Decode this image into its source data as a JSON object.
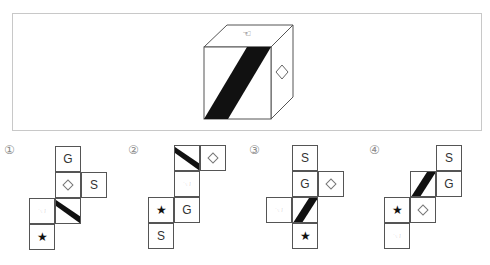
{
  "header": {
    "text": ""
  },
  "problem": {
    "cube": {
      "top_face": "pointing-hand",
      "front_face": "diagonal-stripe",
      "right_face": "diamond"
    }
  },
  "symbols": {
    "G": "G",
    "S": "S",
    "star": "★",
    "pointer": "☜",
    "diamond": "",
    "stripe": ""
  },
  "options": [
    {
      "label": "①",
      "cells": [
        {
          "col": 1,
          "row": 0,
          "sym": "G"
        },
        {
          "col": 1,
          "row": 1,
          "sym": "diamond"
        },
        {
          "col": 2,
          "row": 1,
          "sym": "S"
        },
        {
          "col": 0,
          "row": 2,
          "sym": "pointer"
        },
        {
          "col": 1,
          "row": 2,
          "sym": "stripe-down"
        },
        {
          "col": 0,
          "row": 3,
          "sym": "star"
        }
      ]
    },
    {
      "label": "②",
      "cells": [
        {
          "col": 1,
          "row": 0,
          "sym": "stripe-down"
        },
        {
          "col": 2,
          "row": 0,
          "sym": "diamond"
        },
        {
          "col": 1,
          "row": 1,
          "sym": "pointer"
        },
        {
          "col": 0,
          "row": 2,
          "sym": "star"
        },
        {
          "col": 1,
          "row": 2,
          "sym": "G"
        },
        {
          "col": 0,
          "row": 3,
          "sym": "S"
        }
      ]
    },
    {
      "label": "③",
      "cells": [
        {
          "col": 1,
          "row": 0,
          "sym": "S"
        },
        {
          "col": 1,
          "row": 1,
          "sym": "G"
        },
        {
          "col": 2,
          "row": 1,
          "sym": "diamond"
        },
        {
          "col": 0,
          "row": 2,
          "sym": "pointer"
        },
        {
          "col": 1,
          "row": 2,
          "sym": "stripe-up"
        },
        {
          "col": 1,
          "row": 3,
          "sym": "star"
        }
      ]
    },
    {
      "label": "④",
      "cells": [
        {
          "col": 2,
          "row": 0,
          "sym": "S"
        },
        {
          "col": 1,
          "row": 1,
          "sym": "stripe-up"
        },
        {
          "col": 2,
          "row": 1,
          "sym": "G"
        },
        {
          "col": 0,
          "row": 2,
          "sym": "star"
        },
        {
          "col": 1,
          "row": 2,
          "sym": "diamond"
        },
        {
          "col": 0,
          "row": 3,
          "sym": "pointer"
        }
      ]
    }
  ],
  "layout": {
    "option_origins": [
      {
        "label_x": 4,
        "label_y": 143,
        "x": 29,
        "y": 146
      },
      {
        "label_x": 128,
        "label_y": 143,
        "x": 148,
        "y": 145
      },
      {
        "label_x": 249,
        "label_y": 143,
        "x": 266,
        "y": 145
      },
      {
        "label_x": 369,
        "label_y": 143,
        "x": 384,
        "y": 145
      }
    ]
  },
  "colors": {
    "line": "#555555",
    "fill": "#111111",
    "frame": "#c8c8c8"
  }
}
